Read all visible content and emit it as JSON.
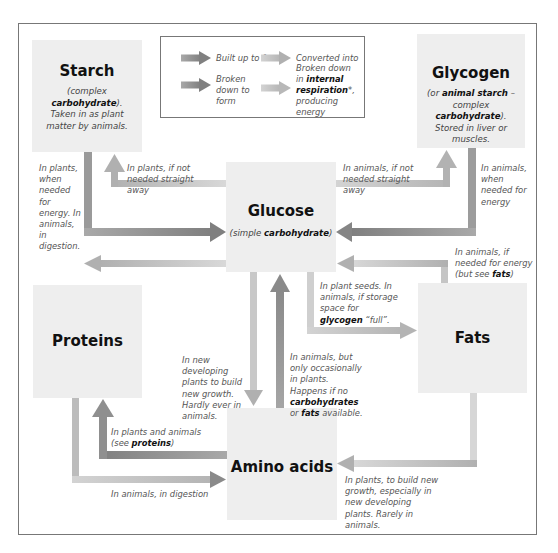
{
  "key": {
    "built_up": "Built up to form",
    "converted": "Converted into",
    "broken_down": "Broken down to form",
    "respiration_pre": "Broken down in ",
    "respiration_bold": "internal respiration",
    "respiration_post": "*, producing energy",
    "colors": {
      "built_up": "#8c8c8c",
      "broken_down": "#bdbdbd"
    }
  },
  "nodes": {
    "starch": {
      "title": "Starch",
      "desc_pre": "(complex ",
      "desc_bold": "carbohydrate",
      "desc_post": "). Taken in as plant matter by animals."
    },
    "glycogen": {
      "title": "Glycogen",
      "desc_pre": "(or ",
      "desc_bold": "animal starch",
      "desc_mid": " – complex ",
      "desc_bold2": "carbohydrate",
      "desc_post": "). Stored in liver or muscles."
    },
    "glucose": {
      "title": "Glucose",
      "desc_pre": "(simple ",
      "desc_bold": "carbohydrate",
      "desc_post": ")"
    },
    "proteins": {
      "title": "Proteins"
    },
    "fats": {
      "title": "Fats"
    },
    "amino": {
      "title": "Amino acids"
    }
  },
  "notes": {
    "starch_to_glucose": "In plants, when needed for energy. In animals, in digestion.",
    "glucose_to_starch": "In plants, if not needed straight away",
    "glucose_to_glycogen": "In animals, if not needed straight away",
    "glycogen_to_glucose": "In animals, when needed for energy",
    "fats_to_glucose_pre": "In animals, if needed for energy (but see ",
    "fats_to_glucose_bold": "fats",
    "fats_to_glucose_post": ")",
    "glucose_to_fats_pre": "In plant seeds. In animals, if storage space for ",
    "glucose_to_fats_bold": "glycogen",
    "glucose_to_fats_post": " “full”.",
    "glucose_to_amino": "In new developing plants to build new growth. Hardly ever in animals.",
    "amino_to_glucose_pre": "In animals, but only occasionally in plants. Happens if no ",
    "amino_to_glucose_bold1": "carbohydrates",
    "amino_to_glucose_mid": " or ",
    "amino_to_glucose_bold2": "fats",
    "amino_to_glucose_post": " available.",
    "amino_to_proteins_pre": "In plants and animals (see ",
    "amino_to_proteins_bold": "proteins",
    "amino_to_proteins_post": ")",
    "proteins_to_amino": "In animals, in digestion",
    "fats_to_amino": "In plants, to build new growth, especially in new developing plants. Rarely in animals."
  }
}
